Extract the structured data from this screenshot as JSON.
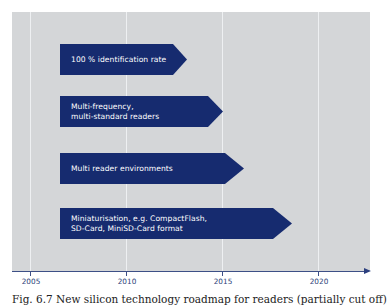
{
  "diagram": {
    "type": "timeline-roadmap",
    "colors": {
      "panel_background": "#d4d6d8",
      "gridline": "#eef0f2",
      "arrow_fill": "#162b6f",
      "arrow_text": "#ffffff",
      "axis": "#3d4f86",
      "axis_label": "#2c3f79"
    },
    "axis": {
      "ticks": [
        {
          "label": "2005",
          "x": 30
        },
        {
          "label": "2010",
          "x": 126
        },
        {
          "label": "2015",
          "x": 222
        },
        {
          "label": "2020",
          "x": 318
        }
      ]
    },
    "arrows": [
      {
        "label": "100 % identification rate",
        "start_year": 2006.6,
        "end_year": 2013.3,
        "top": 44,
        "body_width": 113,
        "tip_x": 187
      },
      {
        "label": "Multi-frequency,\nmulti-standard readers",
        "start_year": 2006.6,
        "end_year": 2015.1,
        "top": 96,
        "body_width": 148,
        "tip_x": 223
      },
      {
        "label": "Multi reader environments",
        "start_year": 2006.6,
        "end_year": 2016.2,
        "top": 153,
        "body_width": 165,
        "tip_x": 244
      },
      {
        "label": "Miniaturisation, e.g. CompactFlash,\nSD-Card, MiniSD-Card format",
        "start_year": 2006.6,
        "end_year": 2018.7,
        "top": 208,
        "body_width": 213,
        "tip_x": 292
      }
    ],
    "caption": "Fig. 6.7  New silicon technology roadmap for readers (partially cut off)"
  }
}
